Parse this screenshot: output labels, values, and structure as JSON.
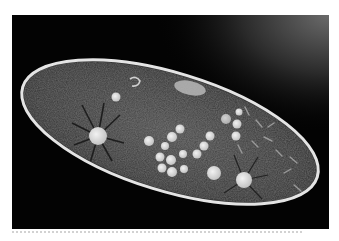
{
  "image": {
    "subject": "paramecium micrograph",
    "caption": "",
    "colors": {
      "background": "#030303",
      "cell_membrane": "#e6e6e6",
      "cytoplasm": "#3a3a3a",
      "vacuole": "#d8d8d8",
      "page": "#ffffff",
      "divider": "#d2d2d2"
    }
  },
  "cell": {
    "center": [
      158,
      117
    ],
    "rx": 154,
    "ry": 59,
    "rotation_deg": 17
  },
  "contractile_vacuoles": [
    {
      "name": "left",
      "cx": 86,
      "cy": 121,
      "r": 9
    },
    {
      "name": "right",
      "cx": 232,
      "cy": 165,
      "r": 8
    }
  ],
  "food_vacuoles": [
    {
      "cx": 137,
      "cy": 126,
      "r": 5
    },
    {
      "cx": 153,
      "cy": 131,
      "r": 4
    },
    {
      "cx": 160,
      "cy": 122,
      "r": 5
    },
    {
      "cx": 168,
      "cy": 114,
      "r": 4.5
    },
    {
      "cx": 175,
      "cy": 112,
      "r": 4
    },
    {
      "cx": 148,
      "cy": 142,
      "r": 4.5
    },
    {
      "cx": 159,
      "cy": 145,
      "r": 5
    },
    {
      "cx": 171,
      "cy": 139,
      "r": 4
    },
    {
      "cx": 150,
      "cy": 153,
      "r": 4.5
    },
    {
      "cx": 160,
      "cy": 157,
      "r": 5
    },
    {
      "cx": 172,
      "cy": 154,
      "r": 4
    },
    {
      "cx": 185,
      "cy": 139,
      "r": 4.5
    },
    {
      "cx": 192,
      "cy": 131,
      "r": 4.5
    },
    {
      "cx": 198,
      "cy": 121,
      "r": 4.5
    },
    {
      "cx": 202,
      "cy": 158,
      "r": 7
    },
    {
      "cx": 214,
      "cy": 104,
      "r": 5
    },
    {
      "cx": 225,
      "cy": 109,
      "r": 4.5
    },
    {
      "cx": 224,
      "cy": 121,
      "r": 4.5
    },
    {
      "cx": 227,
      "cy": 97,
      "r": 3.5
    },
    {
      "cx": 104,
      "cy": 82,
      "r": 4.5
    }
  ],
  "oral_groove": {
    "cx": 178,
    "cy": 73,
    "rx": 16,
    "ry": 7
  }
}
